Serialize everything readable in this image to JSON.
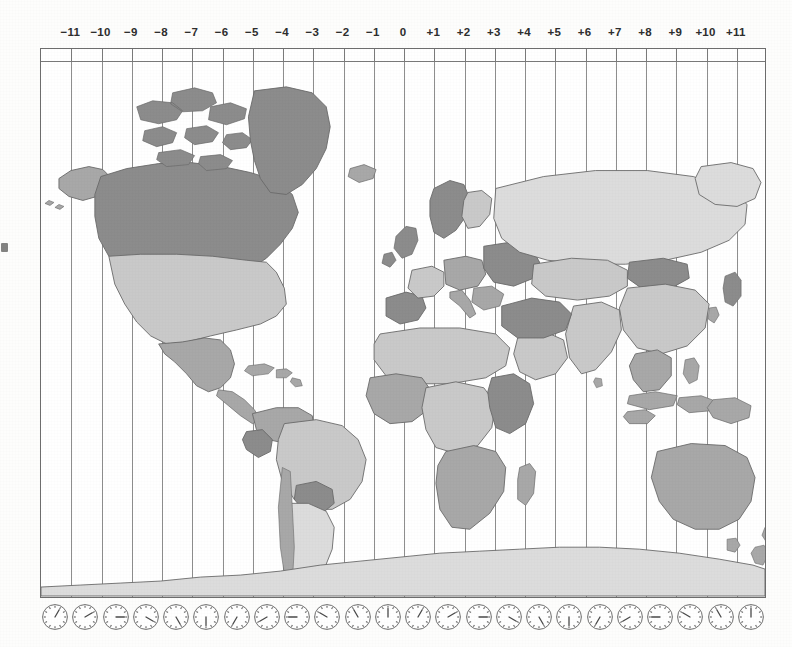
{
  "page": {
    "background_color": "#fdfdfc",
    "frame_color": "#6d6d6d",
    "meridian_color": "#8e8e8e"
  },
  "scale": {
    "name": "utc-offset-ruler",
    "labels": [
      "−11",
      "−10",
      "−9",
      "−8",
      "−7",
      "−6",
      "−5",
      "−4",
      "−3",
      "−2",
      "−1",
      "0",
      "+1",
      "+2",
      "+3",
      "+4",
      "+5",
      "+6",
      "+7",
      "+8",
      "+9",
      "+10",
      "+11"
    ],
    "offsets": [
      -11,
      -10,
      -9,
      -8,
      -7,
      -6,
      -5,
      -4,
      -3,
      -2,
      -1,
      0,
      1,
      2,
      3,
      4,
      5,
      6,
      7,
      8,
      9,
      10,
      11
    ],
    "label_color": "#2e2e2e"
  },
  "clocks": {
    "name": "clock-face-row",
    "count": 24,
    "hours": [
      1,
      2,
      3,
      4,
      5,
      6,
      7,
      8,
      9,
      10,
      11,
      12,
      1,
      2,
      3,
      4,
      5,
      6,
      7,
      8,
      9,
      10,
      11,
      12
    ],
    "face_color": "#ffffff",
    "rim_color": "#6f6f6f",
    "hand_color": "#4a4a4a"
  },
  "map": {
    "name": "world-map",
    "projection": "equirectangular",
    "shading_legend": [
      {
        "tone": "dark",
        "hex": "#8c8c8c",
        "meaning": "dark-shaded-country"
      },
      {
        "tone": "medium",
        "hex": "#a8a8a8",
        "meaning": "medium-shaded-country"
      },
      {
        "tone": "light",
        "hex": "#c9c9c9",
        "meaning": "light-shaded-country"
      },
      {
        "tone": "pale",
        "hex": "#dcdcdc",
        "meaning": "pale-shaded-country"
      }
    ],
    "regions": [
      {
        "name": "greenland",
        "tone": "dark"
      },
      {
        "name": "canada",
        "tone": "dark"
      },
      {
        "name": "alaska",
        "tone": "medium"
      },
      {
        "name": "united-states",
        "tone": "light"
      },
      {
        "name": "mexico",
        "tone": "medium"
      },
      {
        "name": "central-america",
        "tone": "medium"
      },
      {
        "name": "caribbean-islands",
        "tone": "medium"
      },
      {
        "name": "colombia-venezuela",
        "tone": "medium"
      },
      {
        "name": "peru-ecuador",
        "tone": "dark"
      },
      {
        "name": "brazil",
        "tone": "light"
      },
      {
        "name": "bolivia-paraguay",
        "tone": "dark"
      },
      {
        "name": "argentina-chile",
        "tone": "pale"
      },
      {
        "name": "iceland",
        "tone": "medium"
      },
      {
        "name": "british-isles",
        "tone": "dark"
      },
      {
        "name": "scandinavia",
        "tone": "dark"
      },
      {
        "name": "iberia",
        "tone": "dark"
      },
      {
        "name": "france",
        "tone": "light"
      },
      {
        "name": "central-europe",
        "tone": "medium"
      },
      {
        "name": "eastern-europe",
        "tone": "dark"
      },
      {
        "name": "italy-balkans",
        "tone": "medium"
      },
      {
        "name": "turkey-middle-east",
        "tone": "dark"
      },
      {
        "name": "arabian-peninsula",
        "tone": "light"
      },
      {
        "name": "north-africa",
        "tone": "light"
      },
      {
        "name": "west-africa",
        "tone": "medium"
      },
      {
        "name": "central-africa",
        "tone": "light"
      },
      {
        "name": "east-africa",
        "tone": "dark"
      },
      {
        "name": "southern-africa",
        "tone": "medium"
      },
      {
        "name": "madagascar",
        "tone": "medium"
      },
      {
        "name": "russia",
        "tone": "pale"
      },
      {
        "name": "central-asia",
        "tone": "light"
      },
      {
        "name": "mongolia",
        "tone": "dark"
      },
      {
        "name": "china",
        "tone": "light"
      },
      {
        "name": "india",
        "tone": "light"
      },
      {
        "name": "southeast-asia",
        "tone": "medium"
      },
      {
        "name": "japan",
        "tone": "dark"
      },
      {
        "name": "korea",
        "tone": "medium"
      },
      {
        "name": "indonesia",
        "tone": "medium"
      },
      {
        "name": "philippines",
        "tone": "medium"
      },
      {
        "name": "papua-new-guinea",
        "tone": "medium"
      },
      {
        "name": "australia",
        "tone": "medium"
      },
      {
        "name": "new-zealand",
        "tone": "medium"
      },
      {
        "name": "antarctica",
        "tone": "pale"
      }
    ]
  }
}
